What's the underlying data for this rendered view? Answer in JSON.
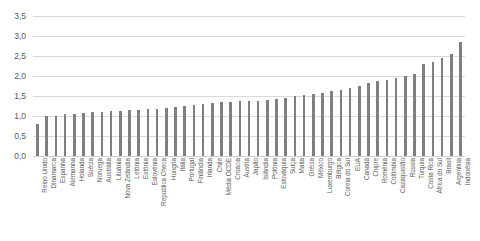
{
  "chart_data": {
    "type": "bar",
    "title": "",
    "subtitle": "",
    "xlabel": "",
    "ylabel": "",
    "ylim": [
      0.0,
      3.5
    ],
    "ytick_labels": [
      "0,0",
      "0,5",
      "1,0",
      "1,5",
      "2,0",
      "2,5",
      "3,0",
      "3,5"
    ],
    "ytick_values": [
      0.0,
      0.5,
      1.0,
      1.5,
      2.0,
      2.5,
      3.0,
      3.5
    ],
    "grid": "horizontal",
    "legend": "none",
    "bar_color": "#7f7f7f",
    "gridline_color": "#d9d9d9",
    "decimal_separator": ",",
    "categories": [
      "Reino Unido",
      "Dinamarca",
      "Espanha",
      "Alemanha",
      "Holanda",
      "Suécia",
      "Noruega",
      "Austrália",
      "Lituânia",
      "Nova Zelândia",
      "Letónia",
      "Estónia",
      "Eslovénia",
      "República Checa",
      "Hungria",
      "Itália",
      "Portugal",
      "Finlândia",
      "Irlanda",
      "Chile",
      "Média OCDE",
      "Croácia",
      "Áustria",
      "Japão",
      "Islândia",
      "Polónia",
      "Eslováquia",
      "Suíça",
      "Malta",
      "Grécia",
      "México",
      "Luxemburgo",
      "Bélgica",
      "Coreia do Sul",
      "EUA",
      "Canadá",
      "Chipre",
      "Roménia",
      "Colômbia",
      "Cazaquistão",
      "Rússia",
      "Turquia",
      "Costa Rica",
      "África do Sul",
      "Brasil",
      "Argentina",
      "Indonésia"
    ],
    "values": [
      0.8,
      1.0,
      1.0,
      1.05,
      1.06,
      1.07,
      1.1,
      1.1,
      1.12,
      1.13,
      1.14,
      1.15,
      1.17,
      1.18,
      1.2,
      1.22,
      1.25,
      1.27,
      1.3,
      1.32,
      1.35,
      1.35,
      1.37,
      1.38,
      1.38,
      1.4,
      1.42,
      1.45,
      1.5,
      1.52,
      1.55,
      1.58,
      1.62,
      1.65,
      1.7,
      1.75,
      1.82,
      1.88,
      1.9,
      1.95,
      2.0,
      2.05,
      2.3,
      2.35,
      2.45,
      2.55,
      2.85
    ]
  }
}
